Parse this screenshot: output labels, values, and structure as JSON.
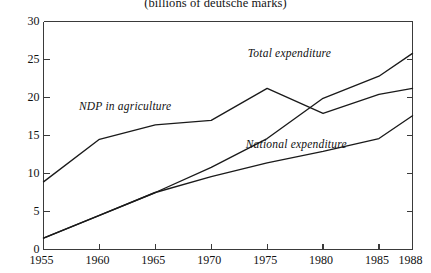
{
  "chart_data": {
    "type": "line",
    "title": "(billions of deutsche marks)",
    "xlabel": "",
    "ylabel": "",
    "xlim": [
      1955,
      1988
    ],
    "ylim": [
      0,
      30
    ],
    "xticks": [
      1955,
      1960,
      1965,
      1970,
      1975,
      1980,
      1985,
      1988
    ],
    "yticks": [
      0,
      5,
      10,
      15,
      20,
      25,
      30
    ],
    "grid": false,
    "legend_position": "inline-annotations",
    "x": [
      1955,
      1960,
      1965,
      1970,
      1975,
      1980,
      1985,
      1988
    ],
    "series": [
      {
        "name": "NDP in agriculture",
        "values": [
          8.9,
          14.5,
          16.4,
          17.0,
          21.2,
          17.9,
          20.4,
          21.2
        ],
        "color": "#1a1a1a"
      },
      {
        "name": "Total expenditure",
        "values": [
          1.5,
          4.5,
          7.5,
          10.8,
          14.6,
          19.9,
          22.8,
          25.8
        ],
        "color": "#1a1a1a"
      },
      {
        "name": "National expenditure",
        "values": [
          1.5,
          4.5,
          7.5,
          9.6,
          11.4,
          12.9,
          14.6,
          17.6
        ],
        "color": "#1a1a1a"
      }
    ],
    "annotations": [
      {
        "text": "NDP in agriculture",
        "x": 1962.3,
        "y": 18.6
      },
      {
        "text": "Total expenditure",
        "x": 1977.0,
        "y": 25.6
      },
      {
        "text": "National expenditure",
        "x": 1977.6,
        "y": 13.6
      }
    ]
  }
}
